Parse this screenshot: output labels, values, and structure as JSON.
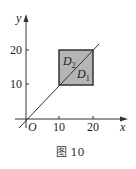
{
  "figure": {
    "caption": "图 10",
    "axes": {
      "x_label": "x",
      "y_label": "y",
      "origin_label": "O",
      "x_ticks": [
        "10",
        "20"
      ],
      "y_ticks": [
        "10",
        "20"
      ]
    },
    "regions": {
      "upper": "D",
      "upper_sub": "2",
      "lower": "D",
      "lower_sub": "1"
    },
    "colors": {
      "square_fill": "#b5b5b5",
      "stroke": "#333333"
    }
  }
}
